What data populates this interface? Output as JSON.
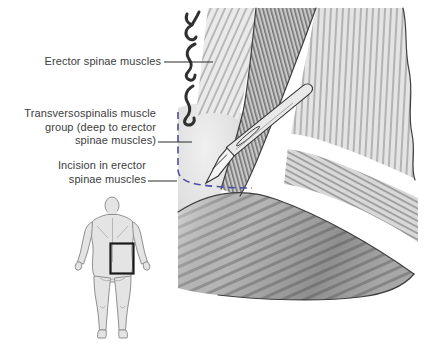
{
  "labels": {
    "erector_spinae": {
      "lines": [
        "Erector spinae muscles"
      ]
    },
    "transversospinalis": {
      "lines": [
        "Transversospinalis muscle",
        "group (deep to erector",
        "spinae muscles)"
      ]
    },
    "incision": {
      "lines": [
        "Incision in erector",
        "spinae muscles"
      ]
    }
  },
  "icons": {
    "scalpel": "scalpel-icon",
    "spinous_processes": "spinous-process-hooks-icon",
    "body_locator": "body-posterior-silhouette-icon"
  },
  "colors": {
    "background": "#ffffff",
    "label_text": "#3d3d3d",
    "leader_line": "#2b2b2b",
    "incision_boundary_dash": "#4d4da8",
    "locator_box": "#1a1a1a",
    "body_silhouette_fill": "#e4e4e4",
    "muscle_light": "#e7e7e7",
    "muscle_mid": "#c9c9c9",
    "muscle_shadow": "#9a9a9a",
    "fascia_band": "#ffffff",
    "outline": "#3f3f3f"
  }
}
